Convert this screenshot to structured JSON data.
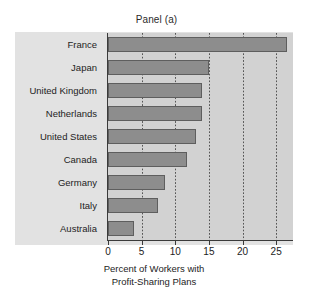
{
  "chart_data": {
    "type": "bar",
    "orientation": "horizontal",
    "title": "Panel (a)",
    "xlabel_line1": "Percent of Workers with",
    "xlabel_line2": "Profit-Sharing Plans",
    "ylabel": "",
    "categories": [
      "France",
      "Japan",
      "United Kingdom",
      "Netherlands",
      "United States",
      "Canada",
      "Germany",
      "Italy",
      "Australia"
    ],
    "values": [
      26.6,
      15.0,
      14.0,
      14.0,
      13.1,
      11.8,
      8.5,
      7.4,
      3.9
    ],
    "xlim": [
      0,
      27.5
    ],
    "xticks": [
      0,
      5,
      10,
      15,
      20,
      25
    ],
    "xtick_labels": [
      "0",
      "5",
      "10",
      "15",
      "20",
      "25"
    ],
    "grid": "vertical-dotted",
    "legend": "none",
    "bar_color": "#8d8d8d",
    "bar_edge_color": "#5e5e5e",
    "plot_background": "#d2d2d2",
    "panel_background": "#e2e2e2",
    "axis_color": "#3a3a3a",
    "text_color": "#1d1d1d"
  }
}
